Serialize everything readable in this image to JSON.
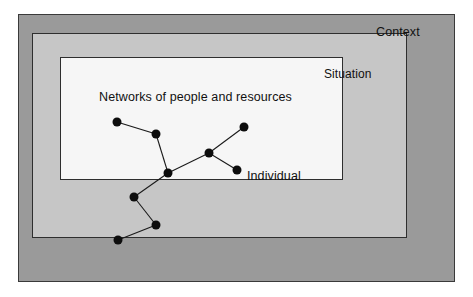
{
  "diagram": {
    "layers": [
      {
        "id": "context",
        "label": "Context",
        "fill": "#9a9a9a",
        "stroke": "#3a3a3a"
      },
      {
        "id": "situation",
        "label": "Situation",
        "fill": "#c6c6c6",
        "stroke": "#2e2e2e"
      },
      {
        "id": "network",
        "label": "Networks of people and resources",
        "fill": "#f6f6f6",
        "stroke": "#2e2e2e"
      }
    ],
    "annotations": [
      {
        "id": "individual",
        "label": "Individual"
      }
    ],
    "graph": {
      "node_color": "#0d0d0d",
      "node_radius": 4.5,
      "edge_color": "#1a1a1a",
      "nodes": [
        {
          "id": "n1",
          "x": 117,
          "y": 122
        },
        {
          "id": "n2",
          "x": 156,
          "y": 134
        },
        {
          "id": "n3",
          "x": 168,
          "y": 173
        },
        {
          "id": "n4",
          "x": 209,
          "y": 153
        },
        {
          "id": "n5",
          "x": 244,
          "y": 127
        },
        {
          "id": "n6",
          "x": 237,
          "y": 170
        },
        {
          "id": "n7",
          "x": 134,
          "y": 197
        },
        {
          "id": "n8",
          "x": 156,
          "y": 225
        },
        {
          "id": "n9",
          "x": 118,
          "y": 240
        }
      ],
      "edges": [
        {
          "from": "n1",
          "to": "n2"
        },
        {
          "from": "n2",
          "to": "n3"
        },
        {
          "from": "n3",
          "to": "n4"
        },
        {
          "from": "n4",
          "to": "n5"
        },
        {
          "from": "n4",
          "to": "n6"
        },
        {
          "from": "n3",
          "to": "n7"
        },
        {
          "from": "n7",
          "to": "n8"
        },
        {
          "from": "n8",
          "to": "n9"
        }
      ]
    }
  }
}
